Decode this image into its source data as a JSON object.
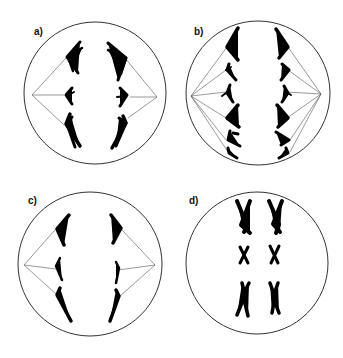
{
  "figure": {
    "panels": [
      {
        "label": "a)",
        "stage": "anaphase-with-sister-chromatids-separating",
        "chromosome_pairs": 3
      },
      {
        "label": "b)",
        "stage": "anaphase-many-chromosomes",
        "chromosome_pairs": 5
      },
      {
        "label": "c)",
        "stage": "anaphase-single-chromatids",
        "chromosome_pairs": 3
      },
      {
        "label": "d)",
        "stage": "metaphase-condensed-chromosomes-no-spindle",
        "chromosome_pairs": 3
      }
    ],
    "colors": {
      "cell_outline": "#333333",
      "spindle": "#555555",
      "chromosome": "#000000",
      "background": "#ffffff"
    }
  }
}
